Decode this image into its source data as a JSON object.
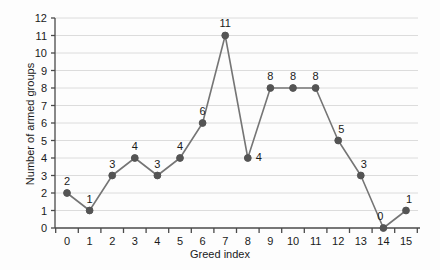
{
  "chart_data": {
    "type": "line",
    "title": "",
    "xlabel": "Greed index",
    "ylabel": "Number of armed groups",
    "x": [
      0,
      1,
      2,
      3,
      4,
      5,
      6,
      7,
      8,
      9,
      10,
      11,
      12,
      13,
      14,
      15
    ],
    "values": [
      2,
      1,
      3,
      4,
      3,
      4,
      6,
      11,
      4,
      8,
      8,
      8,
      5,
      3,
      0,
      1
    ],
    "point_labels": [
      "2",
      "1",
      "3",
      "4",
      "3",
      "4",
      "6",
      "11",
      "4",
      "8",
      "8",
      "8",
      "5",
      "3",
      "0",
      "1"
    ],
    "xticklabels": [
      "0",
      "1",
      "2",
      "3",
      "4",
      "5",
      "6",
      "7",
      "8",
      "9",
      "10",
      "11",
      "12",
      "13",
      "14",
      "15"
    ],
    "yticklabels": [
      "0",
      "1",
      "2",
      "3",
      "4",
      "5",
      "6",
      "7",
      "8",
      "9",
      "10",
      "11",
      "12"
    ],
    "ylim": [
      0,
      12
    ],
    "grid": true,
    "legend": "none",
    "line_color": "#757575",
    "marker_color": "#545454",
    "grid_color": "#dcdcdc",
    "axis_color": "#4a4a4a",
    "text_color": "#1a1a1a",
    "background": "#fdfdfd"
  }
}
